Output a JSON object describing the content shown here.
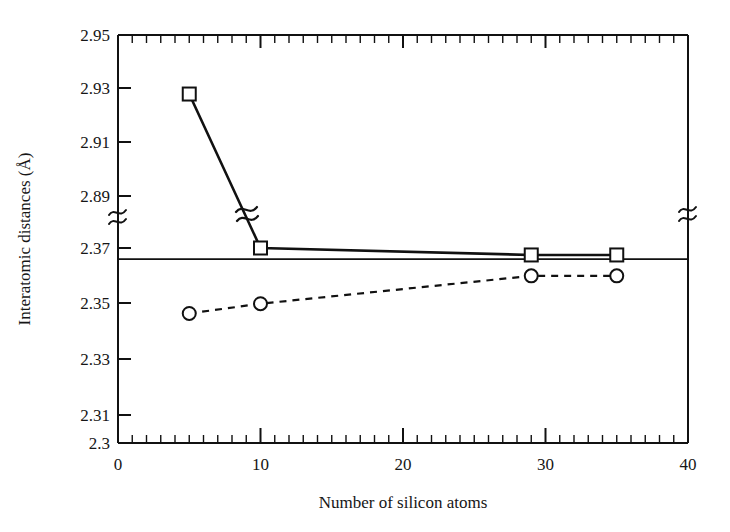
{
  "chart_data": {
    "type": "line",
    "title": "",
    "xlabel": "Number of silicon atoms",
    "ylabel": "Interatomic distances (Å)",
    "xlim": [
      0,
      40
    ],
    "ylim": [
      2.3,
      2.95
    ],
    "axis_break": {
      "present": true,
      "between": [
        2.89,
        2.37
      ],
      "on_axes": [
        "left",
        "right"
      ],
      "on_series": [
        "squares-series"
      ]
    },
    "grid": false,
    "legend": null,
    "xticks_major": [
      0,
      10,
      20,
      30,
      40
    ],
    "xtick_labels": [
      "0",
      "10",
      "20",
      "30",
      "40"
    ],
    "xticks_minor_step": 1,
    "yticks_major": [
      2.3,
      2.31,
      2.33,
      2.35,
      2.37,
      2.89,
      2.91,
      2.93,
      2.95
    ],
    "ytick_labels": [
      "2.3",
      "2.31",
      "2.33",
      "2.35",
      "2.37",
      "2.89",
      "2.91",
      "2.93",
      "2.95"
    ],
    "reference_line": {
      "orientation": "horizontal",
      "value": 2.366,
      "style": "solid"
    },
    "series": [
      {
        "name": "squares-series",
        "marker": "square",
        "linestyle": "solid",
        "color": "#111111",
        "x": [
          5,
          10,
          29,
          35
        ],
        "values": [
          2.928,
          2.37,
          2.3675,
          2.3675
        ]
      },
      {
        "name": "circles-series",
        "marker": "circle",
        "linestyle": "dashed",
        "color": "#111111",
        "x": [
          5,
          10,
          29,
          35
        ],
        "values": [
          2.3465,
          2.35,
          2.36,
          2.36
        ]
      }
    ]
  },
  "figure": {
    "background": "#ffffff",
    "foreground": "#111111"
  }
}
